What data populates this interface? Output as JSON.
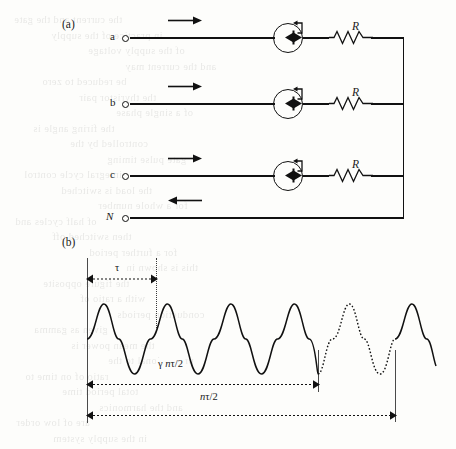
{
  "figure": {
    "panels": [
      {
        "id": "a",
        "label": "(a)",
        "caption_kind": "three-phase-thyristor-circuit"
      },
      {
        "id": "b",
        "label": "(b)",
        "caption_kind": "sinusoidal-timing-waveform"
      }
    ]
  },
  "circuit": {
    "rows": [
      {
        "terminal": "a",
        "italic": false,
        "arrow": "right",
        "has_thyristor": true,
        "resistor_label": "R"
      },
      {
        "terminal": "b",
        "italic": false,
        "arrow": "right",
        "has_thyristor": true,
        "resistor_label": "R"
      },
      {
        "terminal": "c",
        "italic": false,
        "arrow": "right",
        "has_thyristor": true,
        "resistor_label": "R"
      },
      {
        "terminal": "N",
        "italic": true,
        "arrow": "left",
        "has_thyristor": false,
        "resistor_label": ""
      }
    ],
    "bus": {
      "name": "common-right-bus"
    },
    "device_symbol": "triac-with-gate"
  },
  "waveform": {
    "markers": {
      "tau": "τ",
      "gamma_interval": "γ nτ/2",
      "gamma_symbol": "γ",
      "n_symbol": "n",
      "tau_over_two": "τ/2",
      "full_interval": "nτ/2",
      "full_interval_n": "n",
      "full_interval_rest": "τ/2"
    },
    "cycles": {
      "solid_before": 3,
      "dotted": 1,
      "solid_after_partial": 1,
      "total_visible": 5
    },
    "style": {
      "solid_stroke": "#111111",
      "dotted_stroke": "#111111"
    }
  },
  "chart_data": {
    "type": "line",
    "title": "",
    "xlabel": "",
    "ylabel": "",
    "series": [
      {
        "name": "conducting-half-cycles",
        "style": "solid",
        "cycles": 3
      },
      {
        "name": "blocked-half-cycles",
        "style": "dotted",
        "cycles": 1
      },
      {
        "name": "resumed-cycle",
        "style": "solid",
        "cycles": 1
      }
    ],
    "annotations": [
      {
        "label": "τ",
        "kind": "span",
        "from": 0,
        "to": 1,
        "line_style": "dotted"
      },
      {
        "label": "γ nτ/2",
        "kind": "span",
        "from": 0,
        "to": 3.5,
        "line_style": "dotted"
      },
      {
        "label": "nτ/2",
        "kind": "span",
        "from": 0,
        "to": 4.6,
        "line_style": "dotted"
      }
    ]
  },
  "page_bleed": {
    "lines": [
      "the current and the gate",
      "in practice of the supply",
      "of the supply voltage",
      "and the current may",
      "be reduced to zero",
      "the thyristor pair",
      "of a single phase",
      "the firing angle is",
      "controlled by the",
      "gate pulse timing",
      "integral cycle control",
      "the load is switched",
      "for a whole number",
      "of half cycles and",
      "then switched off",
      "for a further period",
      "this is shown in",
      "the figure opposite",
      "with a ratio of",
      "conduction periods",
      "given as gamma",
      "the mean power is",
      "proportional to the",
      "ratio of on time to",
      "total period time",
      "and the harmonics",
      "are of low order",
      "in the supply system"
    ]
  }
}
